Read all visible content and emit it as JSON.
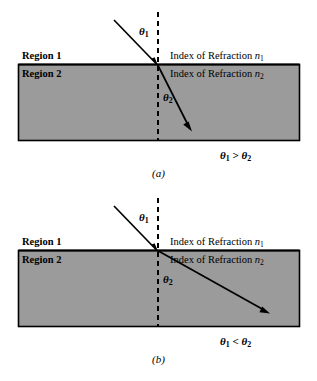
{
  "figure": {
    "colors": {
      "medium_fill": "#9b9b9b",
      "outline": "#000000",
      "background": "#ffffff",
      "ray": "#000000",
      "normal_dashed": "#000000"
    }
  },
  "panels": [
    {
      "id": "a",
      "caption": "(a)",
      "region_upper_label": "Region 1",
      "region_lower_label": "Region 2",
      "index_upper_prefix": "Index of Refraction ",
      "index_upper_symbol": "n",
      "index_upper_sub": "1",
      "index_lower_prefix": "Index of Refraction ",
      "index_lower_symbol": "n",
      "index_lower_sub": "2",
      "theta_incident": "θ",
      "theta_incident_sub": "1",
      "theta_refracted": "θ",
      "theta_refracted_sub": "2",
      "relation_left": "θ",
      "relation_left_sub": "1",
      "relation_operator": ">",
      "relation_right": "θ",
      "relation_right_sub": "2",
      "relation_text": "θ₁ > θ₂"
    },
    {
      "id": "b",
      "caption": "(b)",
      "region_upper_label": "Region 1",
      "region_lower_label": "Region 2",
      "index_upper_prefix": "Index of Refraction ",
      "index_upper_symbol": "n",
      "index_upper_sub": "1",
      "index_lower_prefix": "Index of Refraction ",
      "index_lower_symbol": "n",
      "index_lower_sub": "2",
      "theta_incident": "θ",
      "theta_incident_sub": "1",
      "theta_refracted": "θ",
      "theta_refracted_sub": "2",
      "relation_left": "θ",
      "relation_left_sub": "1",
      "relation_operator": "<",
      "relation_right": "θ",
      "relation_right_sub": "2",
      "relation_text": "θ₁ < θ₂"
    }
  ]
}
